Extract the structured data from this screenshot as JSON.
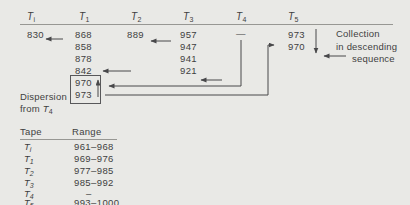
{
  "colors": {
    "background": "#e9e9e6",
    "ink": "#3f3f3f",
    "rule_line": "#979793",
    "arrow": "#48484a",
    "box_border": "#58585a"
  },
  "diagram": {
    "headers": [
      {
        "main": "T",
        "sub": "i"
      },
      {
        "main": "T",
        "sub": "1"
      },
      {
        "main": "T",
        "sub": "2"
      },
      {
        "main": "T",
        "sub": "3"
      },
      {
        "main": "T",
        "sub": "4"
      },
      {
        "main": "T",
        "sub": "5"
      }
    ],
    "columns": {
      "ti": [
        "830"
      ],
      "t1": [
        "868",
        "858",
        "878",
        "842"
      ],
      "t1_boxed": [
        "970",
        "973"
      ],
      "t2": [
        "889"
      ],
      "t3": [
        "957",
        "947",
        "941",
        "921"
      ],
      "t4": [
        "—"
      ],
      "t5": [
        "973",
        "970"
      ]
    },
    "labels": {
      "dispersion_line1": "Dispersion",
      "dispersion_line2_prefix": "from ",
      "dispersion_tape_main": "T",
      "dispersion_tape_sub": "4",
      "collection_line1": "Collection",
      "collection_line2": "in descending",
      "collection_line3": "sequence"
    }
  },
  "table": {
    "headers": [
      "Tape",
      "Range"
    ],
    "rows": [
      {
        "tape_main": "T",
        "tape_sub": "i",
        "range": "961–968"
      },
      {
        "tape_main": "T",
        "tape_sub": "1",
        "range": "969–976"
      },
      {
        "tape_main": "T",
        "tape_sub": "2",
        "range": "977–985"
      },
      {
        "tape_main": "T",
        "tape_sub": "3",
        "range": "985–992"
      },
      {
        "tape_main": "T",
        "tape_sub": "4",
        "range": "–"
      },
      {
        "tape_main": "T",
        "tape_sub": "5",
        "range": "993–1000"
      }
    ]
  }
}
